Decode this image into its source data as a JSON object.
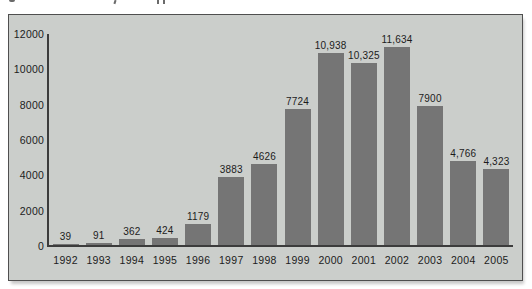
{
  "chart_data": {
    "type": "bar",
    "title": "",
    "xlabel": "",
    "ylabel": "",
    "categories": [
      "1992",
      "1993",
      "1994",
      "1995",
      "1996",
      "1997",
      "1998",
      "1999",
      "2000",
      "2001",
      "2002",
      "2003",
      "2004",
      "2005"
    ],
    "values": [
      39,
      91,
      362,
      424,
      1179,
      3883,
      4626,
      7724,
      10938,
      10325,
      11634,
      7900,
      4766,
      4323
    ],
    "value_labels": [
      "39",
      "91",
      "362",
      "424",
      "1179",
      "3883",
      "4626",
      "7724",
      "10,938",
      "10,325",
      "11,634",
      "7900",
      "4,766",
      "4,323"
    ],
    "y_ticks": [
      "12000",
      "10000",
      "8000",
      "6000",
      "4000",
      "2000",
      "0"
    ],
    "ylim": [
      0,
      12000
    ],
    "grid": false,
    "legend": false,
    "colors": {
      "bar": "#757575",
      "plot_background": "#cbcecb",
      "axis": "#3c3c3c",
      "panel_border": "#4f4f4f",
      "text": "#1c1c1c",
      "page_background": "#ffffff"
    }
  }
}
